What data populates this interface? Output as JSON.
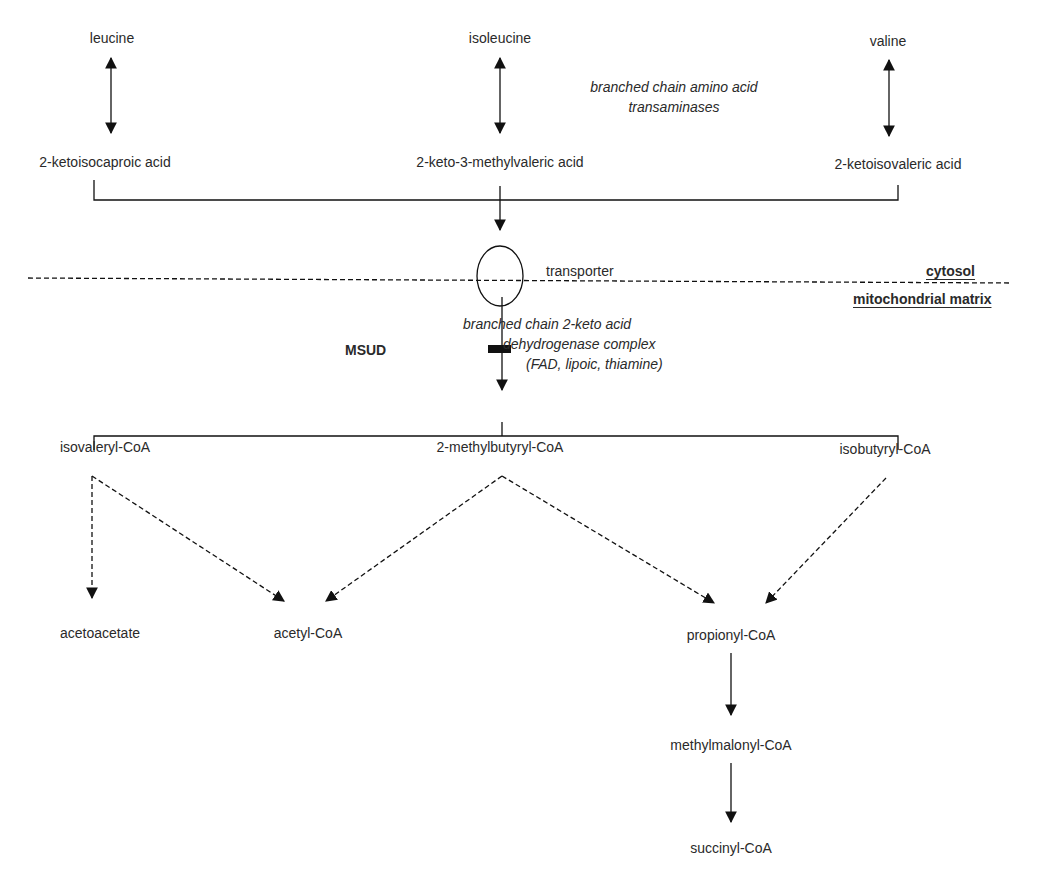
{
  "amino_acids": {
    "leucine": "leucine",
    "isoleucine": "isoleucine",
    "valine": "valine"
  },
  "enzymes": {
    "transaminase_line1": "branched chain amino acid",
    "transaminase_line2": "transaminases",
    "bckdh_line1": "branched chain 2-keto acid",
    "bckdh_line2": "dehydrogenase complex",
    "bckdh_line3": "(FAD, lipoic, thiamine)"
  },
  "keto_acids": {
    "kic": "2-ketoisocaproic acid",
    "kmv": "2-keto-3-methylvaleric acid",
    "kiv": "2-ketoisovaleric acid"
  },
  "membrane": {
    "transporter": "transporter",
    "cytosol": "cytosol",
    "matrix": "mitochondrial matrix"
  },
  "block": {
    "label": "MSUD"
  },
  "acyl_coas": {
    "isovaleryl": "isovaleryl-CoA",
    "methylbutyryl": "2-methylbutyryl-CoA",
    "isobutyryl": "isobutyryl-CoA"
  },
  "products": {
    "acetoacetate": "acetoacetate",
    "acetyl_coa": "acetyl-CoA",
    "propionyl_coa": "propionyl-CoA",
    "methylmalonyl_coa": "methylmalonyl-CoA",
    "succinyl_coa": "succinyl-CoA"
  }
}
